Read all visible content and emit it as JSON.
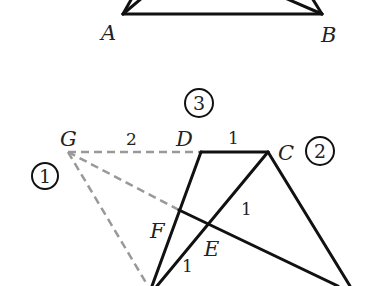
{
  "colors": {
    "solid": "#111111",
    "dashed": "#999999",
    "background": "#ffffff"
  },
  "top_figure": {
    "points": {
      "A": {
        "label": "A",
        "x": 123,
        "y": 14
      },
      "B": {
        "label": "B",
        "x": 322,
        "y": 14
      }
    }
  },
  "bottom_figure": {
    "points": {
      "G": {
        "label": "G",
        "x": 68,
        "y": 152
      },
      "D": {
        "label": "D",
        "x": 201,
        "y": 152
      },
      "C": {
        "label": "C",
        "x": 268,
        "y": 152
      },
      "F": {
        "label": "F",
        "x": 179,
        "y": 210
      },
      "E": {
        "label": "E",
        "x": 227,
        "y": 224
      }
    },
    "segment_labels": {
      "GD": "2",
      "DC": "1",
      "CE": "1",
      "E_bottom": "1"
    },
    "circled_numbers": {
      "one": "1",
      "two": "2",
      "three": "3"
    }
  }
}
